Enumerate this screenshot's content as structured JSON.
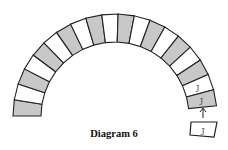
{
  "caption": "Diagram 6",
  "arch": {
    "center": [
      115,
      116
    ],
    "outer_radius": 102,
    "inner_radius": 74,
    "block_count": 19,
    "blocks": [
      {
        "fill": "gray",
        "label": ""
      },
      {
        "fill": "white",
        "label": ""
      },
      {
        "fill": "gray",
        "label": ""
      },
      {
        "fill": "white",
        "label": ""
      },
      {
        "fill": "gray",
        "label": ""
      },
      {
        "fill": "white",
        "label": ""
      },
      {
        "fill": "gray",
        "label": ""
      },
      {
        "fill": "white",
        "label": ""
      },
      {
        "fill": "gray",
        "label": ""
      },
      {
        "fill": "white",
        "label": ""
      },
      {
        "fill": "gray",
        "label": ""
      },
      {
        "fill": "white",
        "label": ""
      },
      {
        "fill": "gray",
        "label": ""
      },
      {
        "fill": "white",
        "label": ""
      },
      {
        "fill": "gray",
        "label": ""
      },
      {
        "fill": "white",
        "label": ""
      },
      {
        "fill": "gray",
        "label": ""
      },
      {
        "fill": "white",
        "label": "J"
      },
      {
        "fill": "gray",
        "label": "J"
      }
    ]
  },
  "loose_block": {
    "fill": "white",
    "label": "J"
  },
  "arrow": "up-arrow",
  "colors": {
    "gray": "#c8c8c8",
    "white": "#ffffff",
    "stroke": "#222222"
  }
}
